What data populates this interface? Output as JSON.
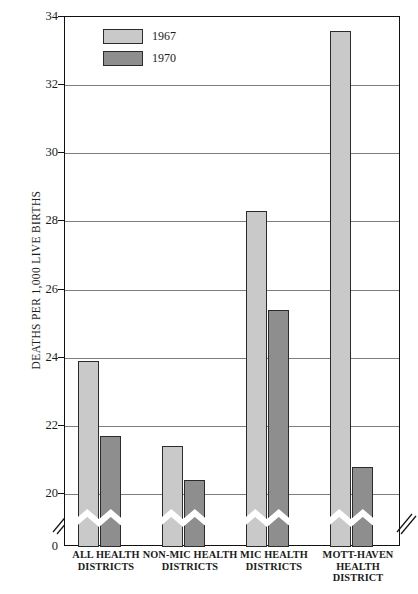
{
  "chart_data": {
    "type": "bar",
    "title": "",
    "xlabel": "",
    "ylabel": "DEATHS PER 1,000 LIVE BIRTHS",
    "categories": [
      "ALL HEALTH DISTRICTS",
      "NON-MIC HEALTH DISTRICTS",
      "MIC HEALTH DISTRICTS",
      "MOTT-HAVEN HEALTH DISTRICT"
    ],
    "category_lines": [
      [
        "ALL HEALTH",
        "DISTRICTS"
      ],
      [
        "NON-MIC HEALTH",
        "DISTRICTS"
      ],
      [
        "MIC HEALTH",
        "DISTRICTS"
      ],
      [
        "MOTT-HAVEN",
        "HEALTH DISTRICT"
      ]
    ],
    "series": [
      {
        "name": "1967",
        "color": "#c9c9c9",
        "values": [
          23.9,
          21.4,
          28.3,
          33.6
        ]
      },
      {
        "name": "1970",
        "color": "#8e8e8e",
        "values": [
          21.7,
          20.4,
          25.4,
          20.8
        ]
      }
    ],
    "ylim": [
      20,
      34
    ],
    "yticks": [
      20,
      22,
      24,
      26,
      28,
      30,
      32,
      34
    ],
    "ytick_labels": [
      "20",
      "22",
      "24",
      "26",
      "28",
      "30",
      "32",
      "34"
    ],
    "zero_tick_label": "0",
    "axis_break": true,
    "axis_break_note": "y-axis broken between 0 and 20",
    "grid": true,
    "legend_position": "top-left-inside",
    "legend_entries": [
      "1967",
      "1970"
    ]
  },
  "caption": {
    "text": ""
  }
}
